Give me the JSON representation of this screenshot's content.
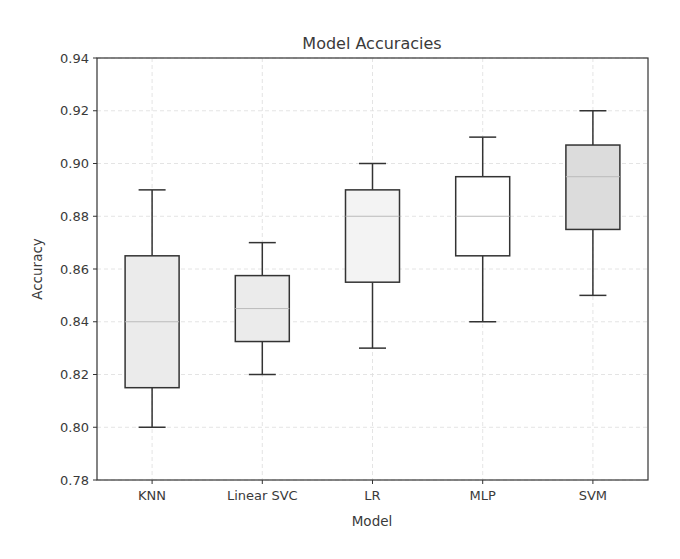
{
  "chart_data": {
    "type": "box",
    "title": "Model Accuracies",
    "xlabel": "Model",
    "ylabel": "Accuracy",
    "ylim": [
      0.78,
      0.94
    ],
    "yticks": [
      "0.78",
      "0.80",
      "0.82",
      "0.84",
      "0.86",
      "0.88",
      "0.90",
      "0.92",
      "0.94"
    ],
    "grid": true,
    "categories": [
      "KNN",
      "Linear SVC",
      "LR",
      "MLP",
      "SVM"
    ],
    "series": [
      {
        "name": "KNN",
        "min": 0.8,
        "q1": 0.815,
        "median": 0.84,
        "q3": 0.865,
        "max": 0.89,
        "fill": "#ebebeb"
      },
      {
        "name": "Linear SVC",
        "min": 0.82,
        "q1": 0.8325,
        "median": 0.845,
        "q3": 0.8575,
        "max": 0.87,
        "fill": "#ebebeb"
      },
      {
        "name": "LR",
        "min": 0.83,
        "q1": 0.855,
        "median": 0.88,
        "q3": 0.89,
        "max": 0.9,
        "fill": "#f3f3f3"
      },
      {
        "name": "MLP",
        "min": 0.84,
        "q1": 0.865,
        "median": 0.88,
        "q3": 0.895,
        "max": 0.91,
        "fill": "#ffffff"
      },
      {
        "name": "SVM",
        "min": 0.85,
        "q1": 0.875,
        "median": 0.895,
        "q3": 0.907,
        "max": 0.92,
        "fill": "#dcdcdc"
      }
    ]
  },
  "colors": {
    "axis": "#333333",
    "grid": "#dddddd",
    "box_edge": "#333333",
    "median": "#bbbbbb"
  }
}
